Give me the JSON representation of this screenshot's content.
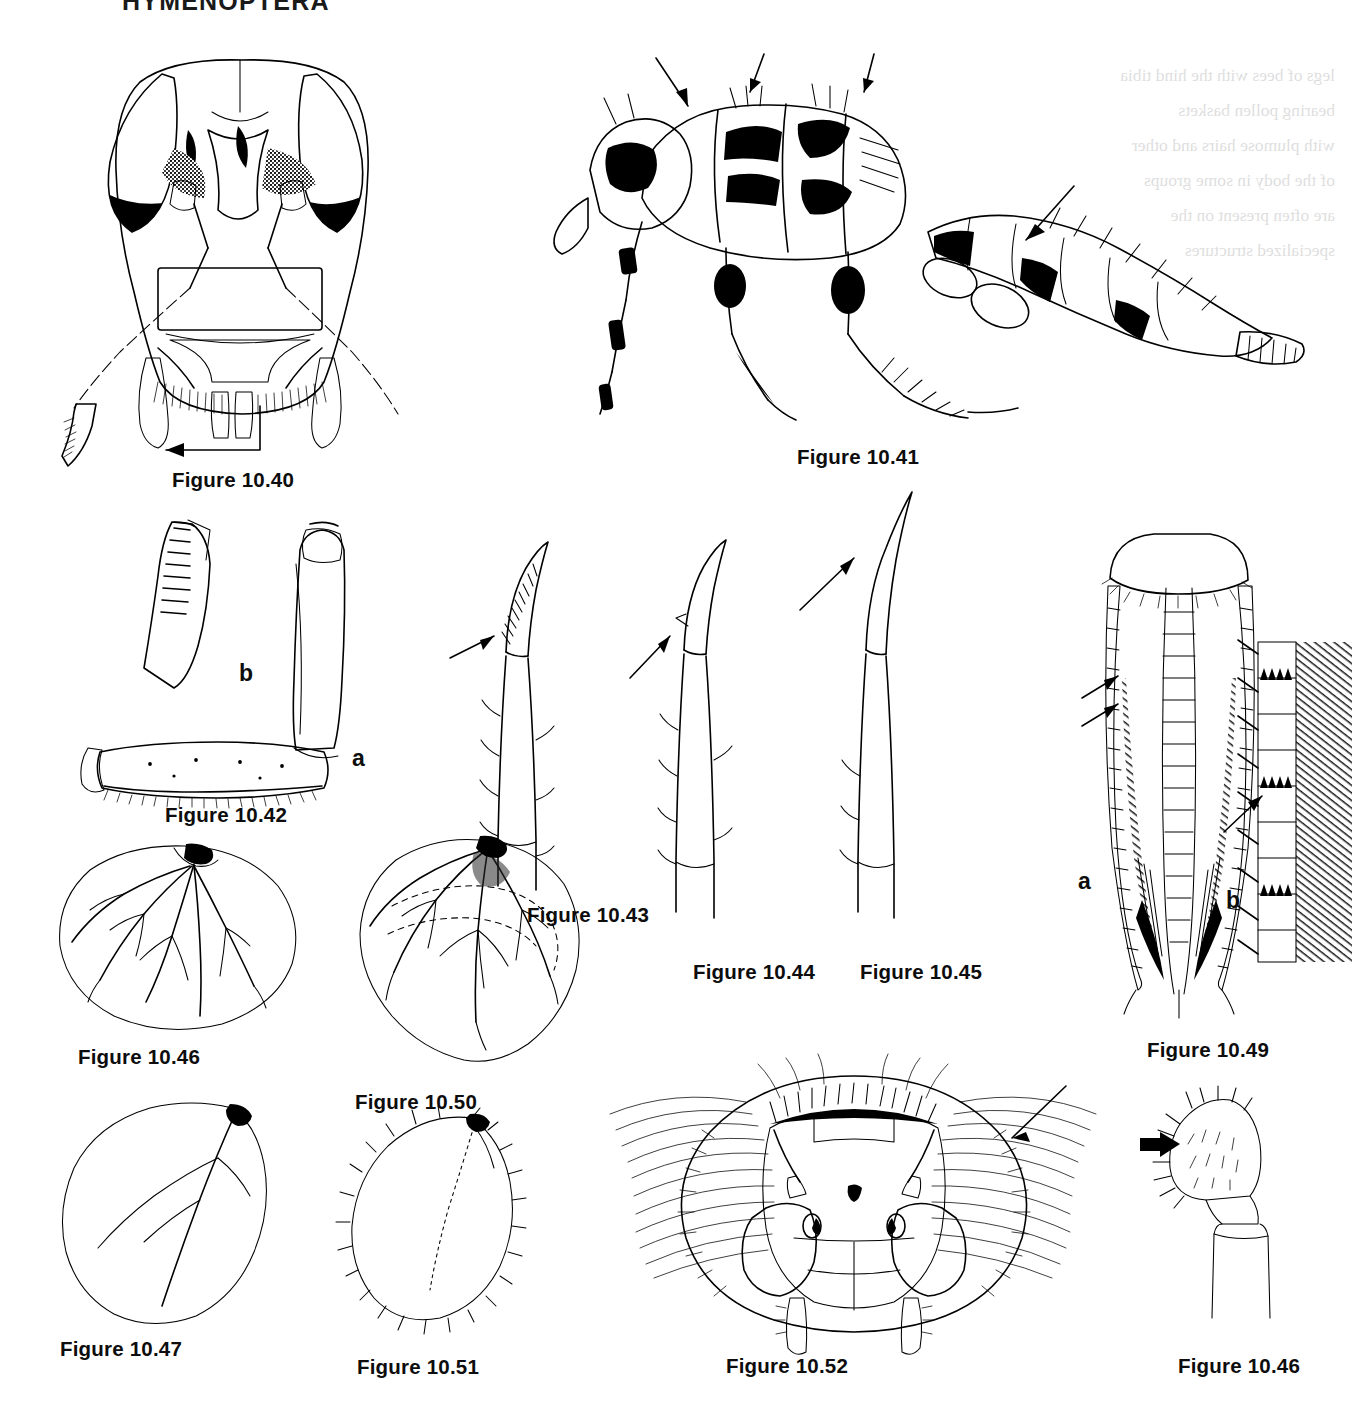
{
  "page": {
    "header": "HYMENOPTERA",
    "background_color": "#ffffff",
    "ink_color": "#000000",
    "width": 1355,
    "height": 1410
  },
  "bleed_through": {
    "note": "faint mirror-image show-through text from the reverse side of the page",
    "lines": [
      "legs of bees with the hind tibia",
      "bearing pollen baskets",
      "with plumose hairs and other",
      "of the body in some groups",
      "are often present on the",
      "specialized structures"
    ]
  },
  "figures": [
    {
      "id": "10.40",
      "caption": "Figure 10.40",
      "subject": "anterior view of a sawfly head showing antennae, compound eyes and mouthparts, with detail of the serrate mandible indicated by an arrow",
      "sublabels": [],
      "caption_pos": {
        "x": 172,
        "y": 468
      }
    },
    {
      "id": "10.41",
      "caption": "Figure 10.41",
      "subject": "lateral habitus of a wingless ant-like hymenopteran showing thorax, legs and gaster, with three arrows indicating dorsal thoracic features",
      "sublabels": [],
      "caption_pos": {
        "x": 797,
        "y": 445
      }
    },
    {
      "id": "10.42",
      "caption": "Figure 10.42",
      "subject": "hind leg of a bee; a = whole tibia and basitarsus, b = enlarged detail of the tibial comb or rastellum",
      "sublabels": [
        {
          "text": "a",
          "x": 352,
          "y": 745
        },
        {
          "text": "b",
          "x": 239,
          "y": 660
        }
      ],
      "caption_pos": {
        "x": 165,
        "y": 803
      }
    },
    {
      "id": "10.43",
      "caption": "Figure 10.43",
      "subject": "tarsal claw and tibial spur with a comb of teeth on the inner margin, indicated by an arrow",
      "sublabels": [],
      "caption_pos": {
        "x": 527,
        "y": 903
      }
    },
    {
      "id": "10.44",
      "caption": "Figure 10.44",
      "subject": "tarsal claw and tibial spur with a small tooth, indicated by an arrow",
      "sublabels": [],
      "caption_pos": {
        "x": 693,
        "y": 960
      }
    },
    {
      "id": "10.45",
      "caption": "Figure 10.45",
      "subject": "simple tarsal claw and tibial spur without teeth, indicated by an arrow",
      "sublabels": [],
      "caption_pos": {
        "x": 860,
        "y": 960
      }
    },
    {
      "id": "10.46",
      "caption": "Figure 10.46",
      "subject": "apex of a leg segment bearing a dense fringe of setae, indicated by a bold arrow",
      "sublabels": [],
      "caption_pos": {
        "x": 1178,
        "y": 1354
      }
    },
    {
      "id": "10.47",
      "caption": "Figure 10.47",
      "subject": "broad rounded hymenopteran wing with reduced branching venation",
      "sublabels": [],
      "caption_pos": {
        "x": 78,
        "y": 1045
      }
    },
    {
      "id": "10.48",
      "caption": "Figure 10.48",
      "subject": "narrow elongate wing with a single longitudinal vein and few branches",
      "sublabels": [],
      "caption_pos": {
        "x": 60,
        "y": 1337
      }
    },
    {
      "id": "10.49",
      "caption": "Figure 10.49",
      "subject": "ventral view of an ovipositor; a = whole ovipositor with sheaths, b = enlarged detail of the serrate lancet teeth indicated by an arrow",
      "sublabels": [
        {
          "text": "a",
          "x": 1078,
          "y": 868
        },
        {
          "text": "b",
          "x": 1226,
          "y": 887
        }
      ],
      "caption_pos": {
        "x": 1147,
        "y": 1038
      }
    },
    {
      "id": "10.50",
      "caption": "Figure 10.50",
      "subject": "wing with dashed outline showing the position of the closed cells and branching veins",
      "sublabels": [],
      "caption_pos": {
        "x": 355,
        "y": 1090
      }
    },
    {
      "id": "10.51",
      "caption": "Figure 10.51",
      "subject": "small ovate wing with a fringe of marginal setae and vestigial venation",
      "sublabels": [],
      "caption_pos": {
        "x": 357,
        "y": 1355
      }
    },
    {
      "id": "10.52",
      "caption": "Figure 10.52",
      "subject": "anterior view of a bee head with hairy compound eyes, three ocelli and antennae, arrow indicating the plumose facial hair",
      "sublabels": [],
      "caption_pos": {
        "x": 726,
        "y": 1354
      }
    }
  ]
}
